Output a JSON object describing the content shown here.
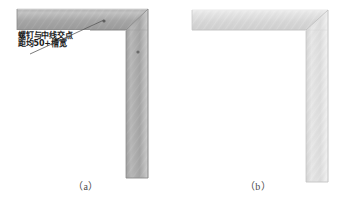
{
  "page": {
    "background_color": "#ffffff",
    "width": 344,
    "height": 204
  },
  "figures": [
    {
      "id": "figure-a",
      "caption": "（a）",
      "description": "L-shaped frame corner with mitered 45 degree joint, darker gray anodized finish, screw locations marked",
      "body_color_light": "#bfbfbf",
      "body_color_dark": "#9a9a9a",
      "edge_color": "#7d7d7d",
      "horizontal_member": {
        "x": 17,
        "y": 9,
        "width": 131,
        "height": 21
      },
      "vertical_member": {
        "x": 126,
        "y": 9,
        "width": 22,
        "height": 169
      },
      "markers": [
        {
          "name": "screw-point-horizontal",
          "cx": 104,
          "cy": 21
        },
        {
          "name": "screw-point-vertical",
          "cx": 138,
          "cy": 52
        }
      ],
      "annotation": {
        "lines": [
          "螺钉与中线交点",
          "距均50+槽宽"
        ],
        "box": {
          "x": 14,
          "y": 30,
          "width": 76,
          "height": 22
        },
        "leader_from": {
          "x": 30,
          "y": 52
        },
        "leader_to": {
          "x": 104,
          "y": 21
        }
      }
    },
    {
      "id": "figure-b",
      "caption": "（b）",
      "description": "L-shaped frame corner with mitered 45 degree joint, light silver brushed finish, no screw markings",
      "body_color_light": "#f0f0f0",
      "body_color_dark": "#d2d2d2",
      "edge_color": "#bdbdbd",
      "horizontal_member": {
        "x": 20,
        "y": 10,
        "width": 113,
        "height": 20
      },
      "vertical_member": {
        "x": 133,
        "y": 10,
        "width": 23,
        "height": 172
      },
      "markers": [],
      "annotation": null
    }
  ]
}
